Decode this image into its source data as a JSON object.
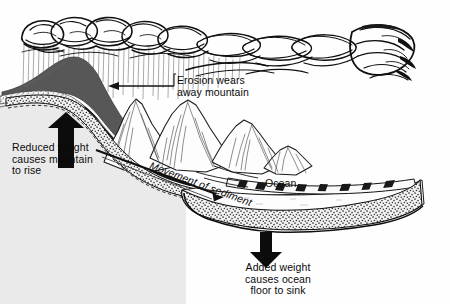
{
  "figure": {
    "background_color": "#fefefe",
    "ink_color": "#0a0a0a"
  },
  "labels": {
    "erosion": "Erosion wears\naway mountain",
    "reduced_weight": "Reduced weight\ncauses mountain\nto rise",
    "added_weight": "Added weight\ncauses ocean\nfloor to sink",
    "ocean": "Ocean",
    "movement_of_sediment": "Movement of sediment"
  },
  "elements": {
    "cloud_band": "cloud-band",
    "rain": "rain-streaks",
    "eroded_mass": "eroded-mountain-mass",
    "mountain_range": "mountain-range",
    "continental_crust": "continental-crust",
    "sediment_wedge": "sediment-wedge",
    "ocean_water": "ocean-water",
    "ocean_crust": "ocean-crust",
    "arrow_up": "up-arrow",
    "arrow_down": "down-arrow",
    "arrow_erosion": "erosion-leader-arrow",
    "arrow_sediment": "sediment-flow-arrow"
  },
  "colors": {
    "eroded_mass_fill": "#585858",
    "land_fill": "#e9e9e9",
    "crust_fill": "#d8d8d8",
    "ocean_fill": "#fbfbfb",
    "stipple": "#3a3a3a",
    "line": "#141414"
  }
}
